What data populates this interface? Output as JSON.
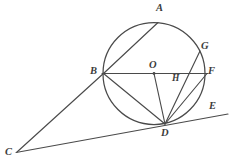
{
  "figure": {
    "type": "geometry-diagram",
    "canvas": {
      "width": 231,
      "height": 168
    },
    "colors": {
      "stroke": "#4a4a4a",
      "label": "#3c3c3c",
      "background": "#ffffff"
    },
    "circle": {
      "center_label": "O",
      "cx": 154,
      "cy": 73.5,
      "r": 51
    },
    "points": [
      {
        "id": "A",
        "label": "A",
        "x": 158,
        "y": 22.5,
        "label_x": 156,
        "label_y": 3,
        "on_circle": true
      },
      {
        "id": "B",
        "label": "B",
        "x": 103.5,
        "y": 73.5,
        "label_x": 90,
        "label_y": 66,
        "on_circle": true
      },
      {
        "id": "C",
        "label": "C",
        "x": 17,
        "y": 152,
        "label_x": 5,
        "label_y": 147,
        "on_circle": false
      },
      {
        "id": "D",
        "label": "D",
        "x": 165,
        "y": 124,
        "label_x": 161,
        "label_y": 128,
        "on_circle": true
      },
      {
        "id": "E",
        "label": "E",
        "x": 228,
        "y": 114,
        "label_x": 209,
        "label_y": 101,
        "on_circle": false
      },
      {
        "id": "F",
        "label": "F",
        "x": 207,
        "y": 73.5,
        "label_x": 208,
        "label_y": 66,
        "on_circle": false
      },
      {
        "id": "G",
        "label": "G",
        "x": 199,
        "y": 52,
        "label_x": 201,
        "label_y": 41,
        "on_circle": true
      },
      {
        "id": "H",
        "label": "H",
        "x": 186,
        "y": 73.5,
        "label_x": 172,
        "label_y": 74,
        "on_circle": false
      },
      {
        "id": "O",
        "label": "O",
        "x": 154,
        "y": 73.5,
        "label_x": 149,
        "label_y": 60,
        "on_circle": false
      }
    ],
    "segments": [
      {
        "id": "BA",
        "from": "B",
        "to": "A",
        "x1": 103.5,
        "y1": 73.5,
        "x2": 158,
        "y2": 22.5
      },
      {
        "id": "BF",
        "from": "B",
        "to": "F",
        "x1": 102,
        "y1": 73.5,
        "x2": 208,
        "y2": 73.5
      },
      {
        "id": "BD",
        "from": "B",
        "to": "D",
        "x1": 103.5,
        "y1": 73.5,
        "x2": 165,
        "y2": 124
      },
      {
        "id": "OD",
        "from": "O",
        "to": "D",
        "x1": 154,
        "y1": 73.5,
        "x2": 165,
        "y2": 124
      },
      {
        "id": "DG",
        "from": "D",
        "to": "G",
        "x1": 165,
        "y1": 124,
        "x2": 200,
        "y2": 51
      },
      {
        "id": "DF",
        "from": "D",
        "to": "F",
        "x1": 165,
        "y1": 124,
        "x2": 207,
        "y2": 73.5
      },
      {
        "id": "CB",
        "from": "C",
        "to": "B",
        "x1": 17,
        "y1": 152,
        "x2": 104,
        "y2": 73
      },
      {
        "id": "CE",
        "from": "C",
        "to": "E",
        "x1": 16,
        "y1": 152.5,
        "x2": 228,
        "y2": 114
      }
    ],
    "dots": [
      {
        "id": "dot-O",
        "x": 154,
        "y": 73.5,
        "r": 1.4
      }
    ]
  }
}
